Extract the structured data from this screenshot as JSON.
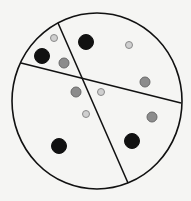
{
  "canvas": {
    "width": 191,
    "height": 201,
    "background": "#f5f5f3"
  },
  "circle": {
    "cx": 97,
    "cy": 101,
    "rx": 85,
    "ry": 88,
    "stroke": "#111111",
    "stroke_width": 1.6
  },
  "lines": [
    {
      "id": "line-a",
      "x1": 58,
      "y1": 23,
      "x2": 128,
      "y2": 183
    },
    {
      "id": "line-b",
      "x1": 21,
      "y1": 63,
      "x2": 181,
      "y2": 103
    }
  ],
  "dot_styles": {
    "large-black": {
      "r": 7.5,
      "fill": "#111111",
      "stroke": "#111111"
    },
    "medium-grey": {
      "r": 5,
      "fill": "#8c8c8c",
      "stroke": "#6a6a6a"
    },
    "small-light": {
      "r": 3.5,
      "fill": "#cfcfcf",
      "stroke": "#8a8a8a"
    }
  },
  "dots": [
    {
      "x": 54,
      "y": 38,
      "type": "small-light"
    },
    {
      "x": 86,
      "y": 42,
      "type": "large-black"
    },
    {
      "x": 129,
      "y": 45,
      "type": "small-light"
    },
    {
      "x": 42,
      "y": 56,
      "type": "large-black"
    },
    {
      "x": 64,
      "y": 63,
      "type": "medium-grey"
    },
    {
      "x": 145,
      "y": 82,
      "type": "medium-grey"
    },
    {
      "x": 76,
      "y": 92,
      "type": "medium-grey"
    },
    {
      "x": 101,
      "y": 92,
      "type": "small-light"
    },
    {
      "x": 86,
      "y": 114,
      "type": "small-light"
    },
    {
      "x": 152,
      "y": 117,
      "type": "medium-grey"
    },
    {
      "x": 132,
      "y": 141,
      "type": "large-black"
    },
    {
      "x": 59,
      "y": 146,
      "type": "large-black"
    }
  ]
}
